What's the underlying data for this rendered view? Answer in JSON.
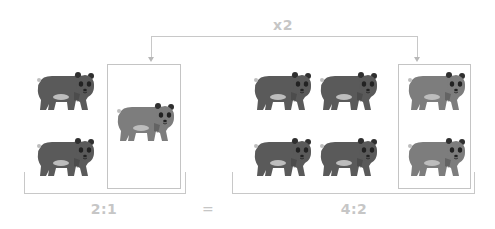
{
  "diagram": {
    "multiplier_label": "x2",
    "left_ratio": "2:1",
    "equals": "=",
    "right_ratio": "4:2",
    "colors": {
      "line": "#c8c8c8",
      "label": "#c6c6c6",
      "bear_dark": "#5a5a5a",
      "bear_light": "#7d7d7d",
      "bear_belly": "#bdbdbd",
      "bear_face": "#2a2a2a"
    },
    "left_group": {
      "unboxed_bears": 2,
      "boxed_bears": 1
    },
    "right_group": {
      "unboxed_bears": 4,
      "boxed_bears": 2
    }
  }
}
